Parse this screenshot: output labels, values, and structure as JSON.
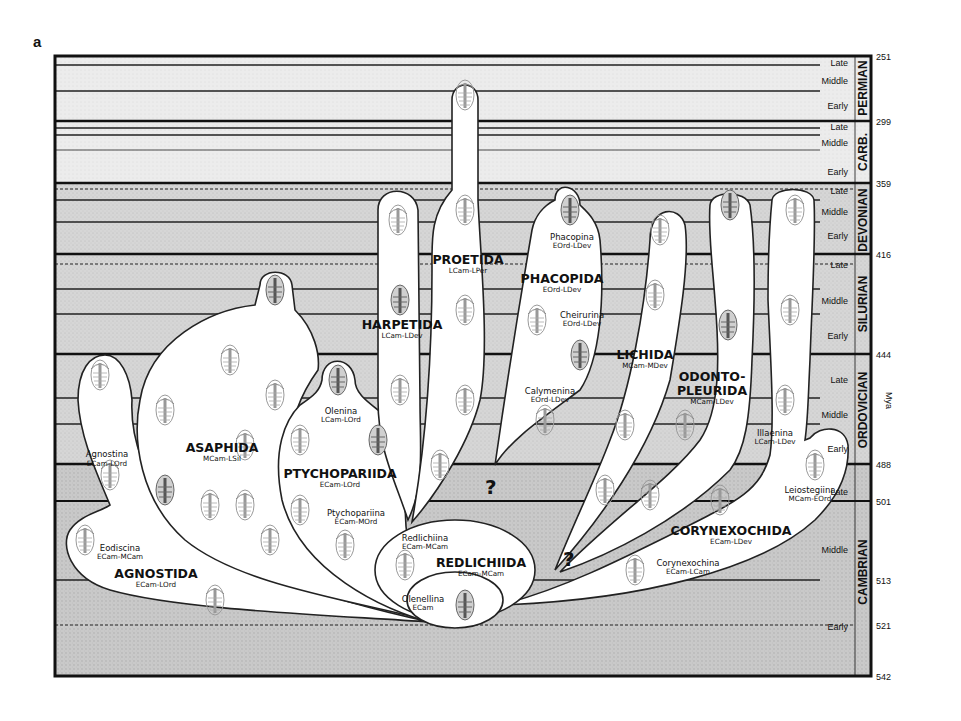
{
  "figure": {
    "panel_label": "a",
    "axis_unit": "Mya"
  },
  "timescale": {
    "boundaries": [
      {
        "mya": "251",
        "y": 56
      },
      {
        "mya": "299",
        "y": 121
      },
      {
        "mya": "359",
        "y": 183
      },
      {
        "mya": "416",
        "y": 254
      },
      {
        "mya": "444",
        "y": 354
      },
      {
        "mya": "488",
        "y": 464
      },
      {
        "mya": "501",
        "y": 501
      },
      {
        "mya": "513",
        "y": 580
      },
      {
        "mya": "521",
        "y": 625
      },
      {
        "mya": "542",
        "y": 676
      }
    ],
    "periods": [
      {
        "name": "PERMIAN",
        "y_top": 56,
        "y_bot": 121,
        "epochs": [
          {
            "name": "Late",
            "y": 63
          },
          {
            "name": "Middle",
            "y": 81
          },
          {
            "name": "Early",
            "y": 106
          }
        ]
      },
      {
        "name": "CARB.",
        "y_top": 121,
        "y_bot": 183,
        "epochs": [
          {
            "name": "Late",
            "y": 128
          },
          {
            "name": "Middle",
            "y": 143
          },
          {
            "name": "Early",
            "y": 172
          }
        ]
      },
      {
        "name": "DEVONIAN",
        "y_top": 183,
        "y_bot": 254,
        "epochs": [
          {
            "name": "Late",
            "y": 191
          },
          {
            "name": "Middle",
            "y": 212
          },
          {
            "name": "Early",
            "y": 236
          }
        ]
      },
      {
        "name": "SILURIAN",
        "y_top": 254,
        "y_bot": 354,
        "epochs": [
          {
            "name": "Late",
            "y": 265
          },
          {
            "name": "Middle",
            "y": 301
          },
          {
            "name": "Early",
            "y": 336
          }
        ]
      },
      {
        "name": "ORDOVICIAN",
        "y_top": 354,
        "y_bot": 464,
        "epochs": [
          {
            "name": "Late",
            "y": 380
          },
          {
            "name": "Middle",
            "y": 415
          },
          {
            "name": "Early",
            "y": 449
          }
        ]
      },
      {
        "name": "CAMBRIAN",
        "y_top": 464,
        "y_bot": 676,
        "epochs": [
          {
            "name": "Late",
            "y": 492
          },
          {
            "name": "Middle",
            "y": 550
          },
          {
            "name": "Early",
            "y": 627
          }
        ]
      }
    ]
  },
  "orders": [
    {
      "name": "AGNOSTIDA",
      "range": "ECam-LOrd",
      "suborders": [
        {
          "name": "Agnostina",
          "range": "ECam-LOrd"
        },
        {
          "name": "Eodiscina",
          "range": "ECam-MCam"
        }
      ]
    },
    {
      "name": "ASAPHIDA",
      "range": "MCam-LSil",
      "suborders": []
    },
    {
      "name": "PTYCHOPARIIDA",
      "range": "ECam-LOrd",
      "suborders": [
        {
          "name": "Olenina",
          "range": "LCam-LOrd"
        },
        {
          "name": "Ptychopariina",
          "range": "ECam-MOrd"
        }
      ]
    },
    {
      "name": "HARPETIDA",
      "range": "LCam-LDev",
      "suborders": []
    },
    {
      "name": "PROETIDA",
      "range": "LCam-LPer",
      "suborders": []
    },
    {
      "name": "PHACOPIDA",
      "range": "EOrd-LDev",
      "suborders": [
        {
          "name": "Phacopina",
          "range": "EOrd-LDev"
        },
        {
          "name": "Cheirurina",
          "range": "EOrd-LDev"
        },
        {
          "name": "Calymenina",
          "range": "EOrd-LDev"
        }
      ]
    },
    {
      "name": "LICHIDA",
      "range": "MCam-MDev",
      "suborders": []
    },
    {
      "name": "ODONTO-",
      "name2": "PLEURIDA",
      "range": "MCam-LDev",
      "suborders": []
    },
    {
      "name": "CORYNEXOCHIDA",
      "range": "ECam-LDev",
      "suborders": [
        {
          "name": "Illaenina",
          "range": "LCam-LDev"
        },
        {
          "name": "Leiostegiina",
          "range": "MCam-EOrd"
        },
        {
          "name": "Corynexochina",
          "range": "ECam-LCam"
        }
      ]
    },
    {
      "name": "REDLICHIIDA",
      "range": "ECam-MCam",
      "suborders": [
        {
          "name": "Redlichiina",
          "range": "ECam-MCam"
        },
        {
          "name": "Olenellina",
          "range": "ECam"
        }
      ]
    }
  ],
  "uncertain_marks": [
    "?",
    "?"
  ],
  "colors": {
    "band_light": "#f4f4f4",
    "band_mid": "#dcdcdc",
    "band_dark": "#cfcfcf",
    "line": "#111111",
    "bubble": "#ffffff",
    "fossil": "#8a8a8a"
  }
}
